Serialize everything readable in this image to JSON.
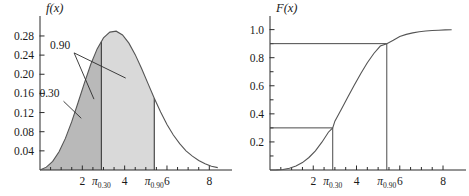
{
  "figure": {
    "caption": "",
    "background": "#ffffff"
  },
  "chart_data": [
    {
      "type": "area",
      "panel": "left",
      "title": "",
      "ylabel": "f(x)",
      "xlabel": "x",
      "xlim": [
        0,
        8.6
      ],
      "ylim": [
        0,
        0.305
      ],
      "xticks": [
        2,
        4,
        6,
        8
      ],
      "xticklabels": [
        "2",
        "4",
        "6",
        "8"
      ],
      "xminorticks": [
        0.5,
        1,
        1.5,
        2.5,
        3,
        3.5,
        4.5,
        5,
        5.5,
        6.5,
        7,
        7.5
      ],
      "yticks": [
        0.04,
        0.08,
        0.12,
        0.16,
        0.2,
        0.24,
        0.28
      ],
      "yticklabels": [
        "0.04",
        "0.08",
        "0.12",
        "0.16",
        "0.20",
        "0.24",
        "0.28"
      ],
      "grid": false,
      "legend": false,
      "series": [
        {
          "name": "pdf",
          "comment": "skewed unimodal density, peak ~0.29 at x~3.6",
          "x": [
            0.0,
            0.3,
            0.6,
            0.9,
            1.2,
            1.5,
            1.8,
            2.1,
            2.4,
            2.7,
            3.0,
            3.3,
            3.6,
            3.9,
            4.2,
            4.5,
            4.8,
            5.1,
            5.4,
            5.7,
            6.0,
            6.3,
            6.6,
            6.9,
            7.2,
            7.5,
            7.8,
            8.1,
            8.4
          ],
          "values": [
            0.0,
            0.006,
            0.018,
            0.038,
            0.066,
            0.101,
            0.141,
            0.182,
            0.221,
            0.253,
            0.276,
            0.288,
            0.29,
            0.282,
            0.265,
            0.241,
            0.212,
            0.181,
            0.15,
            0.121,
            0.095,
            0.073,
            0.055,
            0.04,
            0.029,
            0.02,
            0.013,
            0.008,
            0.005
          ]
        }
      ],
      "shaded_regions": [
        {
          "name": "lower-tail-0.30",
          "from": 0.0,
          "to": 2.9,
          "probability": 0.3,
          "color": "#b9b9b9"
        },
        {
          "name": "region-to-0.90",
          "from": 2.9,
          "to": 5.4,
          "probability": 0.6,
          "color": "#d9d9d9"
        }
      ],
      "annotations": [
        {
          "name": "label-0.90",
          "text": "0.90",
          "x_text": 0.95,
          "y_text": 0.253
        },
        {
          "name": "label-0.30",
          "text": "0.30",
          "x_text": 0.45,
          "y_text": 0.152
        }
      ],
      "quantiles": [
        {
          "name": "pi-0.30",
          "label": "π",
          "sublabel": "0.30",
          "x": 2.9,
          "f": 0.268
        },
        {
          "name": "pi-0.90",
          "label": "π",
          "sublabel": "0.90",
          "x": 5.4,
          "f": 0.15
        }
      ]
    },
    {
      "type": "line",
      "panel": "right",
      "title": "",
      "ylabel": "F(x)",
      "xlabel": "x",
      "xlim": [
        0,
        8.6
      ],
      "ylim": [
        0,
        1.04
      ],
      "xticks": [
        2,
        4,
        6,
        8
      ],
      "xticklabels": [
        "2",
        "4",
        "6",
        "8"
      ],
      "xminorticks": [
        0.5,
        1,
        1.5,
        2.5,
        3,
        3.5,
        4.5,
        5,
        5.5,
        6.5,
        7,
        7.5
      ],
      "yticks": [
        0.2,
        0.4,
        0.6,
        0.8,
        1.0
      ],
      "yticklabels": [
        "0.2",
        "0.4",
        "0.6",
        "0.8",
        "1.0"
      ],
      "yminorticks": [
        0.1,
        0.3,
        0.5,
        0.7,
        0.9
      ],
      "grid": false,
      "legend": false,
      "series": [
        {
          "name": "cdf",
          "comment": "cumulative distribution of the left-panel density",
          "x": [
            0.0,
            0.3,
            0.6,
            0.9,
            1.2,
            1.5,
            1.8,
            2.1,
            2.4,
            2.7,
            2.9,
            3.0,
            3.3,
            3.6,
            3.9,
            4.2,
            4.5,
            4.8,
            5.1,
            5.4,
            5.7,
            6.0,
            6.3,
            6.6,
            6.9,
            7.2,
            7.5,
            7.8,
            8.1,
            8.4
          ],
          "values": [
            0.0,
            0.001,
            0.004,
            0.012,
            0.028,
            0.053,
            0.089,
            0.137,
            0.198,
            0.269,
            0.3,
            0.348,
            0.433,
            0.52,
            0.606,
            0.688,
            0.764,
            0.83,
            0.883,
            0.9,
            0.924,
            0.951,
            0.966,
            0.977,
            0.985,
            0.99,
            0.994,
            0.996,
            0.998,
            0.999
          ]
        }
      ],
      "reference_lines": [
        {
          "name": "hline-0.30",
          "orientation": "horizontal",
          "value": 0.3,
          "from_x": 0.0,
          "to_x": 2.9
        },
        {
          "name": "vline-pi-0.30",
          "orientation": "vertical",
          "value": 2.9,
          "from_y": 0.0,
          "to_y": 0.3
        },
        {
          "name": "hline-0.90",
          "orientation": "horizontal",
          "value": 0.9,
          "from_x": 0.0,
          "to_x": 5.4
        },
        {
          "name": "vline-pi-0.90",
          "orientation": "vertical",
          "value": 5.4,
          "from_y": 0.0,
          "to_y": 0.9
        }
      ],
      "quantiles": [
        {
          "name": "pi-0.30",
          "label": "π",
          "sublabel": "0.30",
          "x": 2.9,
          "F": 0.3
        },
        {
          "name": "pi-0.90",
          "label": "π",
          "sublabel": "0.90",
          "x": 5.4,
          "F": 0.9
        }
      ]
    }
  ]
}
